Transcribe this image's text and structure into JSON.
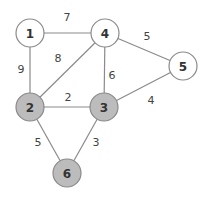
{
  "graph": {
    "colors": {
      "edge": "#8a8a8a",
      "node_stroke": "#8a8a8a",
      "node_fill_default": "#ffffff",
      "node_fill_highlighted": "#bcbcbc",
      "text": "#333333"
    },
    "node_radius": 14,
    "nodes": [
      {
        "id": "1",
        "label": "1",
        "x": 30,
        "y": 33,
        "highlighted": false
      },
      {
        "id": "2",
        "label": "2",
        "x": 30,
        "y": 107,
        "highlighted": true
      },
      {
        "id": "3",
        "label": "3",
        "x": 104,
        "y": 107,
        "highlighted": true
      },
      {
        "id": "4",
        "label": "4",
        "x": 105,
        "y": 33,
        "highlighted": false
      },
      {
        "id": "5",
        "label": "5",
        "x": 183,
        "y": 66,
        "highlighted": false
      },
      {
        "id": "6",
        "label": "6",
        "x": 67,
        "y": 173,
        "highlighted": true
      }
    ],
    "edges": [
      {
        "from": "1",
        "to": "4",
        "weight": "7",
        "label_x": 67,
        "label_y": 21
      },
      {
        "from": "1",
        "to": "2",
        "weight": "9",
        "label_x": 21,
        "label_y": 73
      },
      {
        "from": "2",
        "to": "4",
        "weight": "8",
        "label_x": 58,
        "label_y": 62
      },
      {
        "from": "4",
        "to": "3",
        "weight": "6",
        "label_x": 112,
        "label_y": 79
      },
      {
        "from": "4",
        "to": "5",
        "weight": "5",
        "label_x": 147,
        "label_y": 40
      },
      {
        "from": "2",
        "to": "3",
        "weight": "2",
        "label_x": 68,
        "label_y": 101
      },
      {
        "from": "3",
        "to": "5",
        "weight": "4",
        "label_x": 151,
        "label_y": 104
      },
      {
        "from": "2",
        "to": "6",
        "weight": "5",
        "label_x": 38,
        "label_y": 146
      },
      {
        "from": "3",
        "to": "6",
        "weight": "3",
        "label_x": 96,
        "label_y": 146
      }
    ]
  }
}
